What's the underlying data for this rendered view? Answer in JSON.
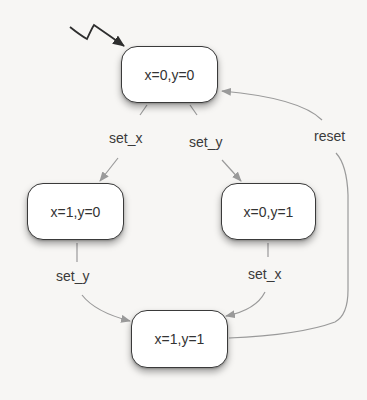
{
  "diagram": {
    "type": "state-machine",
    "states": [
      {
        "id": "s00",
        "label": "x=0,y=0",
        "initial": true
      },
      {
        "id": "s10",
        "label": "x=1,y=0"
      },
      {
        "id": "s01",
        "label": "x=0,y=1"
      },
      {
        "id": "s11",
        "label": "x=1,y=1"
      }
    ],
    "transitions": [
      {
        "from": "s00",
        "to": "s10",
        "label": "set_x"
      },
      {
        "from": "s00",
        "to": "s01",
        "label": "set_y"
      },
      {
        "from": "s10",
        "to": "s11",
        "label": "set_y"
      },
      {
        "from": "s01",
        "to": "s11",
        "label": "set_x"
      },
      {
        "from": "s11",
        "to": "s00",
        "label": "reset"
      }
    ],
    "colors": {
      "node_border": "#3a3a3a",
      "node_fill": "#ffffff",
      "edge": "#9a9a9a",
      "initial_arrow": "#333333",
      "background": "#f7f6f4"
    }
  }
}
